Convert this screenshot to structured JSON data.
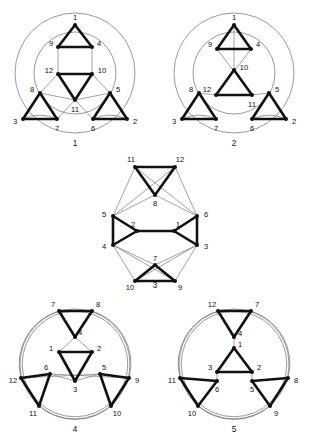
{
  "figure": {
    "title_hidden": "",
    "bottom_caption": "",
    "node_radius": 2.0,
    "colors": {
      "ink": "#111111",
      "thin": "#6f6f6f",
      "background": "#ffffff",
      "faint": "#f3f3f3"
    },
    "stroke": {
      "thick": 2.6,
      "thin": 0.65,
      "circle": 0.7
    }
  },
  "graphs": [
    {
      "id": "graph-1",
      "caption": "1",
      "caption_pos": {
        "x": 75,
        "y": 146
      },
      "circles": [
        {
          "name": "outer-circle",
          "cx": 75,
          "cy": 73,
          "r": 60,
          "double": false
        },
        {
          "name": "inner-arc-top",
          "cx": 75,
          "cy": 73,
          "r": 41,
          "double": false
        }
      ],
      "nodes": [
        {
          "label": "1",
          "x": 75,
          "y": 25,
          "lx": 75,
          "ly": 18,
          "anchor": "middle"
        },
        {
          "label": "9",
          "x": 58,
          "y": 47,
          "lx": 51,
          "ly": 44,
          "anchor": "middle"
        },
        {
          "label": "4",
          "x": 92,
          "y": 47,
          "lx": 99,
          "ly": 44,
          "anchor": "middle"
        },
        {
          "label": "12",
          "x": 58,
          "y": 74,
          "lx": 49,
          "ly": 71,
          "anchor": "middle"
        },
        {
          "label": "10",
          "x": 92,
          "y": 74,
          "lx": 102,
          "ly": 71,
          "anchor": "middle"
        },
        {
          "label": "11",
          "x": 75,
          "y": 100,
          "lx": 75,
          "ly": 110,
          "anchor": "middle"
        },
        {
          "label": "8",
          "x": 40,
          "y": 93,
          "lx": 32,
          "ly": 90,
          "anchor": "middle"
        },
        {
          "label": "5",
          "x": 110,
          "y": 93,
          "lx": 118,
          "ly": 90,
          "anchor": "middle"
        },
        {
          "label": "3",
          "x": 23,
          "y": 119,
          "lx": 15,
          "ly": 122,
          "anchor": "middle"
        },
        {
          "label": "7",
          "x": 57,
          "y": 119,
          "lx": 57,
          "ly": 129,
          "anchor": "middle"
        },
        {
          "label": "6",
          "x": 93,
          "y": 119,
          "lx": 93,
          "ly": 129,
          "anchor": "middle"
        },
        {
          "label": "2",
          "x": 127,
          "y": 119,
          "lx": 135,
          "ly": 122,
          "anchor": "middle"
        }
      ],
      "thick_edges": [
        [
          "1",
          "9"
        ],
        [
          "1",
          "4"
        ],
        [
          "9",
          "4"
        ],
        [
          "12",
          "10"
        ],
        [
          "12",
          "11"
        ],
        [
          "10",
          "11"
        ],
        [
          "8",
          "3"
        ],
        [
          "8",
          "7"
        ],
        [
          "3",
          "7"
        ],
        [
          "5",
          "6"
        ],
        [
          "5",
          "2"
        ],
        [
          "6",
          "2"
        ]
      ],
      "thin_edges": [
        [
          "9",
          "12"
        ],
        [
          "4",
          "10"
        ],
        [
          "8",
          "12"
        ],
        [
          "8",
          "11"
        ],
        [
          "5",
          "10"
        ],
        [
          "5",
          "11"
        ],
        [
          "7",
          "11"
        ],
        [
          "6",
          "11"
        ]
      ],
      "thin_arcs": [
        {
          "from": "3",
          "to": "7",
          "sweep": 1,
          "r": 41
        },
        {
          "from": "6",
          "to": "2",
          "sweep": 1,
          "r": 41
        }
      ]
    },
    {
      "id": "graph-2",
      "caption": "2",
      "caption_pos": {
        "x": 234,
        "y": 146
      },
      "circles": [
        {
          "name": "outer-circle",
          "cx": 234,
          "cy": 73,
          "r": 60,
          "double": false
        },
        {
          "name": "inner-arc-top",
          "cx": 234,
          "cy": 73,
          "r": 41,
          "double": false
        }
      ],
      "nodes": [
        {
          "label": "1",
          "x": 234,
          "y": 25,
          "lx": 234,
          "ly": 18,
          "anchor": "middle"
        },
        {
          "label": "9",
          "x": 217,
          "y": 49,
          "lx": 210,
          "ly": 45,
          "anchor": "middle"
        },
        {
          "label": "4",
          "x": 251,
          "y": 49,
          "lx": 258,
          "ly": 45,
          "anchor": "middle"
        },
        {
          "label": "10",
          "x": 234,
          "y": 70,
          "lx": 244,
          "ly": 68,
          "anchor": "middle"
        },
        {
          "label": "12",
          "x": 216,
          "y": 95,
          "lx": 207,
          "ly": 90,
          "anchor": "middle"
        },
        {
          "label": "11",
          "x": 252,
          "y": 95,
          "lx": 252,
          "ly": 105,
          "anchor": "middle"
        },
        {
          "label": "8",
          "x": 199,
          "y": 93,
          "lx": 191,
          "ly": 90,
          "anchor": "middle"
        },
        {
          "label": "5",
          "x": 269,
          "y": 93,
          "lx": 277,
          "ly": 90,
          "anchor": "middle"
        },
        {
          "label": "3",
          "x": 182,
          "y": 119,
          "lx": 174,
          "ly": 122,
          "anchor": "middle"
        },
        {
          "label": "7",
          "x": 216,
          "y": 119,
          "lx": 216,
          "ly": 129,
          "anchor": "middle"
        },
        {
          "label": "6",
          "x": 252,
          "y": 119,
          "lx": 252,
          "ly": 129,
          "anchor": "middle"
        },
        {
          "label": "2",
          "x": 286,
          "y": 119,
          "lx": 294,
          "ly": 122,
          "anchor": "middle"
        }
      ],
      "thick_edges": [
        [
          "1",
          "9"
        ],
        [
          "1",
          "4"
        ],
        [
          "9",
          "4"
        ],
        [
          "10",
          "12"
        ],
        [
          "10",
          "11"
        ],
        [
          "12",
          "11"
        ],
        [
          "8",
          "3"
        ],
        [
          "8",
          "7"
        ],
        [
          "3",
          "7"
        ],
        [
          "5",
          "6"
        ],
        [
          "5",
          "2"
        ],
        [
          "6",
          "2"
        ]
      ],
      "thin_edges": [
        [
          "9",
          "11"
        ],
        [
          "4",
          "12"
        ],
        [
          "8",
          "12"
        ],
        [
          "5",
          "11"
        ],
        [
          "1",
          "10"
        ]
      ],
      "thin_arcs": [
        {
          "from": "3",
          "to": "7",
          "sweep": 1,
          "r": 41
        },
        {
          "from": "6",
          "to": "2",
          "sweep": 1,
          "r": 41
        }
      ]
    },
    {
      "id": "graph-3",
      "caption": "3",
      "caption_pos": {
        "x": 155,
        "y": 288
      },
      "circles": [],
      "nodes": [
        {
          "label": "11",
          "x": 135,
          "y": 167,
          "lx": 131,
          "ly": 160,
          "anchor": "middle"
        },
        {
          "label": "12",
          "x": 175,
          "y": 167,
          "lx": 180,
          "ly": 160,
          "anchor": "middle"
        },
        {
          "label": "8",
          "x": 155,
          "y": 195,
          "lx": 155,
          "ly": 204,
          "anchor": "middle"
        },
        {
          "label": "5",
          "x": 113,
          "y": 216,
          "lx": 104,
          "ly": 215,
          "anchor": "middle"
        },
        {
          "label": "6",
          "x": 197,
          "y": 216,
          "lx": 206,
          "ly": 215,
          "anchor": "middle"
        },
        {
          "label": "2",
          "x": 137,
          "y": 231,
          "lx": 133,
          "ly": 225,
          "anchor": "middle"
        },
        {
          "label": "1",
          "x": 174,
          "y": 231,
          "lx": 178,
          "ly": 225,
          "anchor": "middle"
        },
        {
          "label": "4",
          "x": 113,
          "y": 245,
          "lx": 104,
          "ly": 247,
          "anchor": "middle"
        },
        {
          "label": "3",
          "x": 197,
          "y": 245,
          "lx": 206,
          "ly": 247,
          "anchor": "middle"
        },
        {
          "label": "7",
          "x": 155,
          "y": 265,
          "lx": 155,
          "ly": 259,
          "anchor": "middle"
        },
        {
          "label": "10",
          "x": 135,
          "y": 281,
          "lx": 130,
          "ly": 288,
          "anchor": "middle"
        },
        {
          "label": "9",
          "x": 175,
          "y": 281,
          "lx": 180,
          "ly": 288,
          "anchor": "middle"
        }
      ],
      "thick_edges": [
        [
          "11",
          "12"
        ],
        [
          "11",
          "8"
        ],
        [
          "12",
          "8"
        ],
        [
          "5",
          "4"
        ],
        [
          "5",
          "2"
        ],
        [
          "4",
          "2"
        ],
        [
          "6",
          "3"
        ],
        [
          "6",
          "1"
        ],
        [
          "3",
          "1"
        ],
        [
          "2",
          "1"
        ],
        [
          "7",
          "10"
        ],
        [
          "7",
          "9"
        ],
        [
          "10",
          "9"
        ]
      ],
      "thin_edges": [
        [
          "11",
          "5"
        ],
        [
          "11",
          "6"
        ],
        [
          "12",
          "5"
        ],
        [
          "12",
          "6"
        ],
        [
          "8",
          "5"
        ],
        [
          "8",
          "6"
        ],
        [
          "4",
          "7"
        ],
        [
          "3",
          "7"
        ],
        [
          "4",
          "10"
        ],
        [
          "3",
          "9"
        ],
        [
          "4",
          "9"
        ],
        [
          "3",
          "10"
        ]
      ],
      "thin_arcs": []
    },
    {
      "id": "graph-4",
      "caption": "4",
      "caption_pos": {
        "x": 75,
        "y": 432
      },
      "circles": [
        {
          "name": "outer-circle",
          "cx": 75,
          "cy": 364,
          "r": 55,
          "double": true
        }
      ],
      "nodes": [
        {
          "label": "7",
          "x": 59,
          "y": 311,
          "lx": 53,
          "ly": 305,
          "anchor": "middle"
        },
        {
          "label": "8",
          "x": 92,
          "y": 311,
          "lx": 98,
          "ly": 305,
          "anchor": "middle"
        },
        {
          "label": "4",
          "x": 75,
          "y": 337,
          "lx": 80,
          "ly": 333,
          "anchor": "middle"
        },
        {
          "label": "1",
          "x": 59,
          "y": 352,
          "lx": 51,
          "ly": 349,
          "anchor": "middle"
        },
        {
          "label": "2",
          "x": 92,
          "y": 352,
          "lx": 99,
          "ly": 349,
          "anchor": "middle"
        },
        {
          "label": "6",
          "x": 50,
          "y": 374,
          "lx": 46,
          "ly": 368,
          "anchor": "middle"
        },
        {
          "label": "5",
          "x": 100,
          "y": 374,
          "lx": 104,
          "ly": 368,
          "anchor": "middle"
        },
        {
          "label": "3",
          "x": 75,
          "y": 381,
          "lx": 75,
          "ly": 390,
          "anchor": "middle"
        },
        {
          "label": "12",
          "x": 21,
          "y": 378,
          "lx": 13,
          "ly": 381,
          "anchor": "middle"
        },
        {
          "label": "9",
          "x": 129,
          "y": 378,
          "lx": 137,
          "ly": 381,
          "anchor": "middle"
        },
        {
          "label": "11",
          "x": 39,
          "y": 406,
          "lx": 33,
          "ly": 414,
          "anchor": "middle"
        },
        {
          "label": "10",
          "x": 111,
          "y": 406,
          "lx": 117,
          "ly": 414,
          "anchor": "middle"
        }
      ],
      "thick_edges": [
        [
          "7",
          "8"
        ],
        [
          "7",
          "4"
        ],
        [
          "8",
          "4"
        ],
        [
          "1",
          "2"
        ],
        [
          "1",
          "3"
        ],
        [
          "2",
          "3"
        ],
        [
          "12",
          "6"
        ],
        [
          "12",
          "11"
        ],
        [
          "6",
          "11"
        ],
        [
          "9",
          "5"
        ],
        [
          "9",
          "10"
        ],
        [
          "5",
          "10"
        ]
      ],
      "thin_edges": [
        [
          "4",
          "1"
        ],
        [
          "4",
          "2"
        ],
        [
          "6",
          "3"
        ],
        [
          "5",
          "3"
        ],
        [
          "12",
          "5"
        ],
        [
          "9",
          "6"
        ]
      ],
      "thin_arcs": [
        {
          "from": "7",
          "to": "12",
          "sweep": 0,
          "r": 55
        },
        {
          "from": "8",
          "to": "9",
          "sweep": 1,
          "r": 55
        },
        {
          "from": "11",
          "to": "10",
          "sweep": 0,
          "r": 55
        }
      ]
    },
    {
      "id": "graph-5",
      "caption": "5",
      "caption_pos": {
        "x": 234,
        "y": 432
      },
      "circles": [
        {
          "name": "outer-circle",
          "cx": 234,
          "cy": 364,
          "r": 55,
          "double": true
        }
      ],
      "nodes": [
        {
          "label": "12",
          "x": 218,
          "y": 311,
          "lx": 212,
          "ly": 305,
          "anchor": "middle"
        },
        {
          "label": "7",
          "x": 251,
          "y": 311,
          "lx": 257,
          "ly": 305,
          "anchor": "middle"
        },
        {
          "label": "4",
          "x": 234,
          "y": 337,
          "lx": 240,
          "ly": 334,
          "anchor": "middle"
        },
        {
          "label": "1",
          "x": 234,
          "y": 348,
          "lx": 240,
          "ly": 345,
          "anchor": "middle"
        },
        {
          "label": "3",
          "x": 217,
          "y": 372,
          "lx": 210,
          "ly": 368,
          "anchor": "middle"
        },
        {
          "label": "2",
          "x": 252,
          "y": 372,
          "lx": 259,
          "ly": 368,
          "anchor": "middle"
        },
        {
          "label": "6",
          "x": 217,
          "y": 381,
          "lx": 217,
          "ly": 390,
          "anchor": "middle"
        },
        {
          "label": "5",
          "x": 252,
          "y": 381,
          "lx": 252,
          "ly": 390,
          "anchor": "middle"
        },
        {
          "label": "11",
          "x": 180,
          "y": 378,
          "lx": 172,
          "ly": 381,
          "anchor": "middle"
        },
        {
          "label": "8",
          "x": 288,
          "y": 378,
          "lx": 296,
          "ly": 381,
          "anchor": "middle"
        },
        {
          "label": "10",
          "x": 198,
          "y": 406,
          "lx": 192,
          "ly": 414,
          "anchor": "middle"
        },
        {
          "label": "9",
          "x": 270,
          "y": 406,
          "lx": 276,
          "ly": 414,
          "anchor": "middle"
        }
      ],
      "thick_edges": [
        [
          "12",
          "7"
        ],
        [
          "12",
          "4"
        ],
        [
          "7",
          "4"
        ],
        [
          "1",
          "3"
        ],
        [
          "1",
          "2"
        ],
        [
          "3",
          "2"
        ],
        [
          "11",
          "6"
        ],
        [
          "11",
          "10"
        ],
        [
          "6",
          "10"
        ],
        [
          "8",
          "5"
        ],
        [
          "8",
          "9"
        ],
        [
          "5",
          "9"
        ]
      ],
      "thin_edges": [
        [
          "3",
          "6"
        ],
        [
          "2",
          "5"
        ],
        [
          "4",
          "1"
        ]
      ],
      "thin_arcs": [
        {
          "from": "12",
          "to": "11",
          "sweep": 0,
          "r": 55
        },
        {
          "from": "7",
          "to": "8",
          "sweep": 1,
          "r": 55
        },
        {
          "from": "10",
          "to": "9",
          "sweep": 0,
          "r": 55
        }
      ]
    }
  ]
}
